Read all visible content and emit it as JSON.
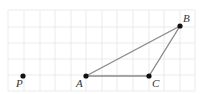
{
  "diagram": {
    "type": "grid-geometry",
    "grid": {
      "x_lines": [
        8,
        24,
        40,
        55,
        71,
        86,
        102,
        117,
        133,
        149,
        164,
        180,
        195
      ],
      "y_lines": [
        10,
        27,
        43,
        59,
        75,
        91
      ],
      "color": "#e6e6e6"
    },
    "points": [
      {
        "id": "P",
        "label": "P",
        "x": 23,
        "y": 76,
        "label_dx": -7,
        "label_dy": 11
      },
      {
        "id": "A",
        "label": "A",
        "x": 86,
        "y": 76,
        "label_dx": -10,
        "label_dy": 11
      },
      {
        "id": "C",
        "label": "C",
        "x": 149,
        "y": 76,
        "label_dx": 3,
        "label_dy": 11
      },
      {
        "id": "B",
        "label": "B",
        "x": 180,
        "y": 26,
        "label_dx": 3,
        "label_dy": -4
      }
    ],
    "segments": [
      {
        "from": "A",
        "to": "B"
      },
      {
        "from": "B",
        "to": "C"
      },
      {
        "from": "A",
        "to": "C"
      }
    ],
    "segment_color": "#8a8a8a"
  }
}
